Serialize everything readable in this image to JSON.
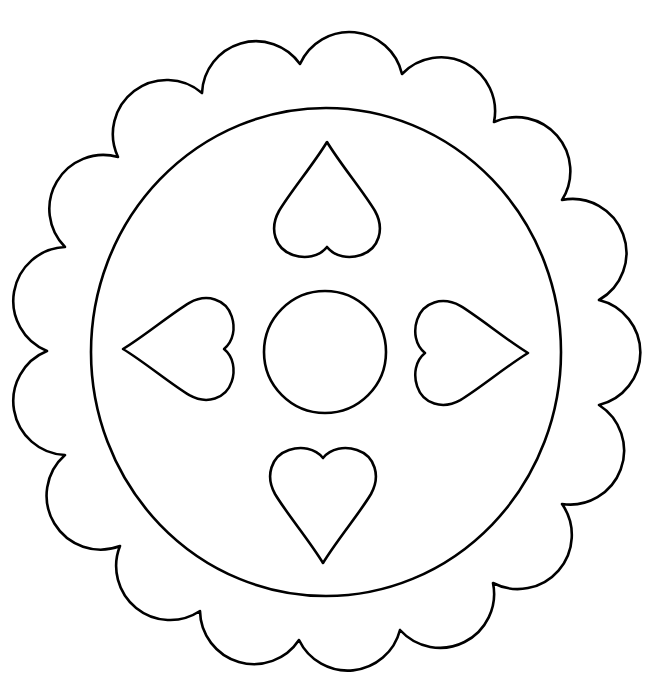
{
  "page": {
    "kind": "coloring-page",
    "background": "#ffffff",
    "line_color": "#000000"
  },
  "shapes": {
    "scalloped_border": {
      "scallop_count": 17,
      "scallop_radius": 54,
      "cusps": [
        [
          300,
          64
        ],
        [
          402,
          74
        ],
        [
          494,
          122
        ],
        [
          562,
          200
        ],
        [
          599,
          300
        ],
        [
          599,
          405
        ],
        [
          562,
          504
        ],
        [
          493,
          583
        ],
        [
          400,
          630
        ],
        [
          299,
          640
        ],
        [
          200,
          611
        ],
        [
          120,
          546
        ],
        [
          65,
          455
        ],
        [
          47,
          351
        ],
        [
          65,
          247
        ],
        [
          118,
          157
        ],
        [
          202,
          93
        ]
      ]
    },
    "inner_circle": {
      "cx": 326,
      "cy": 352,
      "rx": 235,
      "ry": 244
    },
    "center_circle": {
      "cx": 325,
      "cy": 352,
      "r": 61
    },
    "hearts": [
      {
        "position": "top",
        "orientation": "point-up",
        "tip": [
          327,
          142
        ],
        "dip": [
          327,
          247
        ]
      },
      {
        "position": "bottom",
        "orientation": "point-down",
        "tip": [
          323,
          563
        ],
        "dip": [
          323,
          458
        ]
      },
      {
        "position": "left",
        "orientation": "point-left",
        "tip": [
          123,
          349
        ],
        "dip": [
          224,
          349
        ]
      },
      {
        "position": "right",
        "orientation": "point-right",
        "tip": [
          528,
          353
        ],
        "dip": [
          425,
          353
        ]
      }
    ]
  }
}
